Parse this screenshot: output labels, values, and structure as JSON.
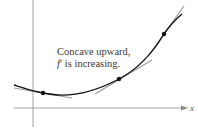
{
  "diagram": {
    "type": "concavity-illustration",
    "annotation_line1": "Concave upward,",
    "annotation_line2_fn": "f",
    "annotation_line2_prime": "′",
    "annotation_line2_rest": " is increasing.",
    "x_axis_label": "x",
    "colors": {
      "curve": "#111111",
      "tangent": "#9a9a9a",
      "axis": "#8a8a8a",
      "point": "#111111",
      "text": "#3a3a3a"
    },
    "points_of_tangency": 3
  }
}
